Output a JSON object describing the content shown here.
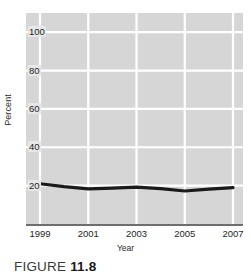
{
  "chart_data": {
    "type": "line",
    "title": "",
    "xlabel": "Year",
    "ylabel": "Percent",
    "x": [
      1999,
      2000,
      2001,
      2002,
      2003,
      2004,
      2005,
      2006,
      2007
    ],
    "values": [
      21,
      19.5,
      18.3,
      18.7,
      19.2,
      18.4,
      17.2,
      18.2,
      19.0
    ],
    "series": [
      {
        "name": "Percent",
        "values": [
          21,
          19.5,
          18.3,
          18.7,
          19.2,
          18.4,
          17.2,
          18.2,
          19.0
        ]
      }
    ],
    "xlim": [
      1999,
      2007
    ],
    "ylim": [
      0,
      110
    ],
    "xticks": [
      1999,
      2001,
      2003,
      2005,
      2007
    ],
    "xtick_labels": [
      "1999",
      "2001",
      "2003",
      "2005",
      "2007"
    ],
    "yticks": [
      20,
      40,
      60,
      80,
      100
    ],
    "ytick_labels": [
      "20",
      "40",
      "60",
      "80",
      "100"
    ],
    "grid": true,
    "grid_color": "#ffffff",
    "plot_background": "#d6d6d6",
    "line_color": "#1a1a1a",
    "legend": null,
    "legend_position": "none"
  },
  "caption": {
    "word": "FIGURE",
    "number": "11.8"
  }
}
